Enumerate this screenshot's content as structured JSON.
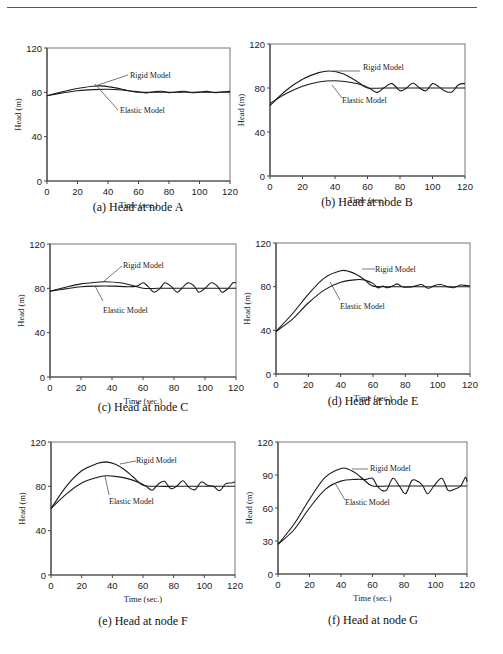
{
  "figure": {
    "panels": [
      {
        "id": "a",
        "caption": "(a) Head at node A"
      },
      {
        "id": "b",
        "caption": "(b) Head at node B"
      },
      {
        "id": "c",
        "caption": "(c) Head at node C"
      },
      {
        "id": "d",
        "caption": "(d) Head at node E"
      },
      {
        "id": "e",
        "caption": "(e) Head at node F"
      },
      {
        "id": "f",
        "caption": "(f) Head at node G"
      }
    ]
  },
  "chart_data": [
    {
      "type": "line",
      "title": "(a) Head at node A",
      "xlabel": "Time (sec.)",
      "ylabel": "Head (m)",
      "xlim": [
        0,
        120
      ],
      "ylim": [
        0,
        120
      ],
      "xticks": [
        0,
        20,
        40,
        60,
        80,
        100,
        120
      ],
      "yticks": [
        0,
        40,
        80,
        120
      ],
      "grid": false,
      "legend": [
        "Rigid Model",
        "Elastic Model"
      ],
      "series": [
        {
          "name": "Rigid Model",
          "x": [
            0,
            10,
            20,
            30,
            35,
            40,
            45,
            50,
            55,
            60,
            70,
            80,
            90,
            100,
            110,
            120
          ],
          "y": [
            77,
            80.5,
            83.5,
            85.5,
            85.8,
            85.2,
            84,
            82.5,
            81,
            80,
            80,
            80,
            80,
            80,
            80,
            80
          ]
        },
        {
          "name": "Elastic Model",
          "x": [
            0,
            10,
            20,
            30,
            40,
            50,
            55,
            60,
            65,
            70,
            75,
            80,
            85,
            90,
            95,
            100,
            105,
            110,
            115,
            120
          ],
          "y": [
            77,
            79.5,
            81.5,
            82.5,
            82.8,
            82,
            81.2,
            80.5,
            79.5,
            80.5,
            81,
            79.8,
            80.3,
            81,
            79.7,
            80.2,
            80.8,
            79.6,
            80.5,
            80.8
          ]
        }
      ]
    },
    {
      "type": "line",
      "title": "(b) Head at node B",
      "xlabel": "Time (sec.)",
      "ylabel": "Head (m)",
      "xlim": [
        0,
        120
      ],
      "ylim": [
        0,
        120
      ],
      "xticks": [
        0,
        20,
        40,
        60,
        80,
        100,
        120
      ],
      "yticks": [
        0,
        40,
        80,
        120
      ],
      "grid": false,
      "legend": [
        "Rigid Model",
        "Elastic Model"
      ],
      "series": [
        {
          "name": "Rigid Model",
          "x": [
            0,
            10,
            20,
            30,
            37,
            45,
            50,
            55,
            60,
            70,
            80,
            90,
            100,
            110,
            120
          ],
          "y": [
            64,
            78,
            88,
            94,
            95.5,
            93,
            89,
            84.5,
            80,
            80,
            80,
            80,
            80,
            80,
            80
          ]
        },
        {
          "name": "Elastic Model",
          "x": [
            0,
            10,
            20,
            30,
            40,
            50,
            58,
            62,
            66,
            70,
            75,
            80,
            84,
            88,
            92,
            96,
            100,
            104,
            108,
            112,
            116,
            120
          ],
          "y": [
            66,
            75,
            81.5,
            85.5,
            86.5,
            85,
            82,
            79,
            76,
            80,
            84,
            77.5,
            80,
            84.5,
            80,
            77.5,
            84,
            81,
            77,
            76.5,
            83,
            84
          ]
        }
      ]
    },
    {
      "type": "line",
      "title": "(c) Head at node C",
      "xlabel": "Time (sec.)",
      "ylabel": "Head (m)",
      "xlim": [
        0,
        120
      ],
      "ylim": [
        0,
        120
      ],
      "xticks": [
        0,
        20,
        40,
        60,
        80,
        100,
        120
      ],
      "yticks": [
        0,
        40,
        80,
        120
      ],
      "grid": false,
      "legend": [
        "Rigid Model",
        "Elastic Model"
      ],
      "series": [
        {
          "name": "Rigid Model",
          "x": [
            0,
            10,
            20,
            30,
            36,
            45,
            52,
            60,
            70,
            80,
            90,
            100,
            110,
            120
          ],
          "y": [
            77.5,
            81,
            84,
            85.5,
            86,
            85,
            83,
            80,
            80,
            80,
            80,
            80,
            80,
            80
          ]
        },
        {
          "name": "Elastic Model",
          "x": [
            0,
            10,
            20,
            30,
            40,
            50,
            56,
            60,
            63,
            67,
            71,
            74,
            78,
            82,
            85,
            89,
            93,
            96,
            100,
            104,
            108,
            111,
            115,
            118,
            120
          ],
          "y": [
            77.5,
            79.5,
            81.5,
            82,
            82,
            81.5,
            82,
            85,
            82,
            76.5,
            80,
            85,
            82,
            76.5,
            80,
            85,
            82,
            76.5,
            80,
            85,
            82,
            76.5,
            80,
            85,
            85
          ]
        }
      ]
    },
    {
      "type": "line",
      "title": "(d) Head at node E",
      "xlabel": "Time (sec.)",
      "ylabel": "Head (m)",
      "xlim": [
        0,
        120
      ],
      "ylim": [
        0,
        120
      ],
      "xticks": [
        0,
        20,
        40,
        60,
        80,
        100,
        120
      ],
      "yticks": [
        0,
        40,
        80,
        120
      ],
      "grid": false,
      "legend": [
        "Rigid Model",
        "Elastic Model"
      ],
      "series": [
        {
          "name": "Rigid Model",
          "x": [
            0,
            10,
            20,
            30,
            40,
            45,
            50,
            55,
            60,
            70,
            80,
            90,
            100,
            110,
            120
          ],
          "y": [
            39,
            55,
            73,
            88,
            94.5,
            94,
            91,
            86,
            80.5,
            80,
            80,
            80,
            80,
            80,
            80
          ]
        },
        {
          "name": "Elastic Model",
          "x": [
            0,
            10,
            20,
            30,
            40,
            50,
            55,
            60,
            63,
            66,
            69,
            72,
            75,
            78,
            82,
            86,
            90,
            94,
            98,
            102,
            106,
            110,
            114,
            118,
            120
          ],
          "y": [
            39,
            50,
            65,
            77,
            84,
            86.5,
            86,
            83,
            79,
            80.5,
            79,
            80.5,
            82.5,
            80,
            79.5,
            80.5,
            82,
            78.5,
            81,
            82,
            80,
            79,
            81.5,
            81,
            80.5
          ]
        }
      ]
    },
    {
      "type": "line",
      "title": "(e) Head at node F",
      "xlabel": "Time (sec.)",
      "ylabel": "Head (m)",
      "xlim": [
        0,
        120
      ],
      "ylim": [
        0,
        120
      ],
      "xticks": [
        0,
        20,
        40,
        60,
        80,
        100,
        120
      ],
      "yticks": [
        0,
        40,
        80,
        120
      ],
      "grid": false,
      "legend": [
        "Rigid Model",
        "Elastic Model"
      ],
      "series": [
        {
          "name": "Rigid Model",
          "x": [
            0,
            10,
            20,
            30,
            36,
            42,
            48,
            54,
            60,
            70,
            80,
            90,
            100,
            110,
            120
          ],
          "y": [
            60,
            80,
            94,
            100.5,
            102,
            100,
            95,
            88,
            81,
            80,
            80,
            80,
            80,
            80,
            80
          ]
        },
        {
          "name": "Elastic Model",
          "x": [
            0,
            10,
            20,
            30,
            36,
            42,
            50,
            58,
            62,
            66,
            70,
            74,
            78,
            82,
            86,
            90,
            94,
            98,
            102,
            106,
            110,
            114,
            118,
            120
          ],
          "y": [
            60,
            73,
            83,
            88,
            89.5,
            89,
            87,
            83,
            80,
            76.5,
            82,
            84.5,
            78,
            80,
            85,
            79,
            77,
            84,
            81,
            80,
            76,
            82.5,
            83,
            84
          ]
        }
      ]
    },
    {
      "type": "line",
      "title": "(f) Head at node G",
      "xlabel": "Time (sec.)",
      "ylabel": "Head (m)",
      "xlim": [
        0,
        120
      ],
      "ylim": [
        0,
        120
      ],
      "xticks": [
        0,
        20,
        40,
        60,
        80,
        100,
        120
      ],
      "yticks": [
        0,
        30,
        60,
        90,
        120
      ],
      "grid": false,
      "legend": [
        "Rigid Model",
        "Elastic Model"
      ],
      "series": [
        {
          "name": "Rigid Model",
          "x": [
            0,
            10,
            20,
            30,
            40,
            45,
            50,
            55,
            60,
            70,
            80,
            90,
            100,
            110,
            120
          ],
          "y": [
            27,
            45,
            68,
            88,
            96,
            95,
            91,
            85,
            80,
            80,
            80,
            80,
            80,
            80,
            80
          ]
        },
        {
          "name": "Elastic Model",
          "x": [
            0,
            10,
            20,
            30,
            40,
            50,
            56,
            60,
            63,
            66,
            69,
            73,
            77,
            81,
            85,
            89,
            92,
            95,
            99,
            104,
            108,
            112,
            116,
            119,
            120
          ],
          "y": [
            27,
            40,
            60,
            77,
            84.5,
            86,
            86,
            87,
            80,
            76,
            76.5,
            87,
            80,
            73,
            85,
            84,
            80,
            73,
            80,
            87,
            76,
            77,
            80,
            88,
            84
          ]
        }
      ]
    }
  ]
}
